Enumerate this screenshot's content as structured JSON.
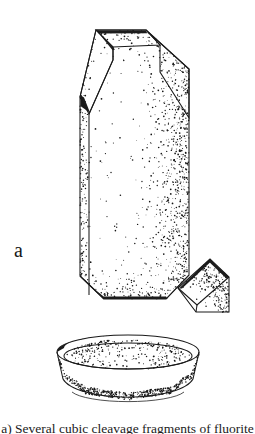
{
  "figure": {
    "domain_kind": "scientific-line-illustration",
    "style": "pen-and-ink stipple drawing",
    "background_color": "#ffffff",
    "ink_color": "#1a1a1a",
    "panel_label": "a",
    "caption_text": "a) Several cubic cleavage fragments of fluorite",
    "caption_clipped": true,
    "objects": [
      {
        "name": "large-prismatic-crystal",
        "label": "large crystal",
        "description": "elongated prismatic crystal with beveled top and bottom corners"
      },
      {
        "name": "cleavage-fragment",
        "label": "cleavage fragment",
        "description": "small tilted rhombohedral fragment at lower right of the crystal"
      },
      {
        "name": "shallow-bowl",
        "label": "shallow dish",
        "description": "elliptical shallow bowl seen in three-quarter perspective"
      }
    ]
  },
  "geometry": {
    "crystal_outline": "M 96,30 L 146,30 L 189,69 L 189,118 L 189,275 L 166,299 L 104,299 L 80,276 L 80,103 L 80,97 Z",
    "crystal_top_face": "M 96,30 L 146,30 L 160,45 L 113,47 Z",
    "crystal_left_bevel": "M 80,97 L 96,30 L 113,47 L 113,60 L 89,114 Z",
    "crystal_right_bevel": "M 146,30 L 189,69 L 189,118 L 160,72 L 160,45 Z",
    "crystal_front_face": "M 113,47 L 160,45 L 160,72 L 189,118 L 189,275 L 166,299 L 104,299 L 80,276 L 80,103 L 89,114 L 113,60 Z",
    "fragment_outline": "M 178,288 L 210,259 L 229,277 L 229,312 L 196,312 Z",
    "fragment_top_facet": "M 178,288 L 210,259 L 229,277 L 197,305 Z",
    "bowl_rim_outer_cx": 128,
    "bowl_rim_outer_cy": 352,
    "bowl_rim_outer_rx": 71,
    "bowl_rim_outer_ry": 17,
    "bowl_rim_inner_rx": 64,
    "bowl_rim_inner_ry": 13,
    "bowl_depth": 40
  },
  "render_params": {
    "stipple_seed": 20260414,
    "crystal_stipple_count": 1150,
    "fragment_stipple_count": 190,
    "bowl_stipple_count": 760
  }
}
